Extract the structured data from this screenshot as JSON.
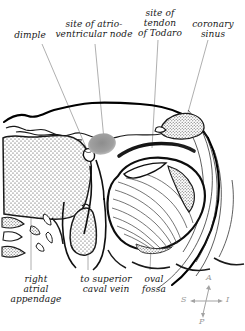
{
  "figure": {
    "labels_top": [
      {
        "id": "dimple",
        "text": "dimple"
      },
      {
        "id": "av-node",
        "text": "site of atrio-\nventricular node"
      },
      {
        "id": "tendon-of-todaro",
        "text": "site of\ntendon\nof Todaro"
      },
      {
        "id": "coronary-sinus",
        "text": "coronary\nsinus"
      }
    ],
    "labels_bottom": [
      {
        "id": "right-atrial-appendage",
        "text": "right\natrial\nappendage"
      },
      {
        "id": "superior-caval-vein",
        "text": "to superior\ncaval vein"
      },
      {
        "id": "oval-fossa",
        "text": "oval\nfossa"
      }
    ],
    "compass": {
      "anterior": "A",
      "posterior": "P",
      "superior": "S",
      "inferior": "I"
    },
    "colors": {
      "ink": "#111111",
      "outline": "#000000",
      "leader_line": "#9a9a9a",
      "av_node_marker": "#9c9c9c",
      "tendon_bar": "#1a1a1a",
      "stipple": "#4a4a4a",
      "compass": "#a3a3a3",
      "background": "#ffffff"
    }
  }
}
